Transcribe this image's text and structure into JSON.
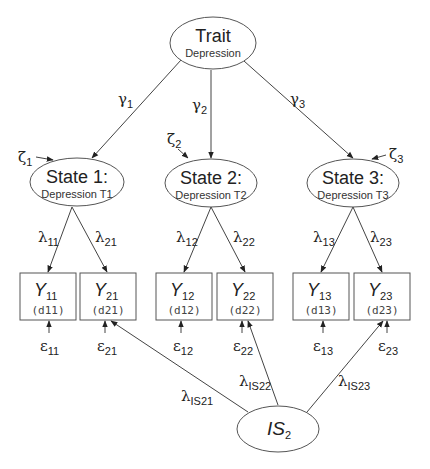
{
  "trait": {
    "title": "Trait",
    "subtitle": "Depression"
  },
  "states": [
    {
      "title": "State 1:",
      "subtitle": "Depression T1",
      "zeta_symbol": "ζ",
      "zeta_sub": "1",
      "gamma_symbol": "γ",
      "gamma_sub": "1"
    },
    {
      "title": "State 2:",
      "subtitle": "Depression T2",
      "zeta_symbol": "ζ",
      "zeta_sub": "2",
      "gamma_symbol": "γ",
      "gamma_sub": "2"
    },
    {
      "title": "State 3:",
      "subtitle": "Depression T3",
      "zeta_symbol": "ζ",
      "zeta_sub": "3",
      "gamma_symbol": "γ",
      "gamma_sub": "3"
    }
  ],
  "observed": [
    {
      "symbol": "Y",
      "sub": "11",
      "code": "(d11)",
      "eps_symbol": "ε",
      "eps_sub": "11",
      "lambda_symbol": "λ",
      "lambda_sub": "11"
    },
    {
      "symbol": "Y",
      "sub": "21",
      "code": "(d21)",
      "eps_symbol": "ε",
      "eps_sub": "21",
      "lambda_symbol": "λ",
      "lambda_sub": "21"
    },
    {
      "symbol": "Y",
      "sub": "12",
      "code": "(d12)",
      "eps_symbol": "ε",
      "eps_sub": "12",
      "lambda_symbol": "λ",
      "lambda_sub": "12"
    },
    {
      "symbol": "Y",
      "sub": "22",
      "code": "(d22)",
      "eps_symbol": "ε",
      "eps_sub": "22",
      "lambda_symbol": "λ",
      "lambda_sub": "22"
    },
    {
      "symbol": "Y",
      "sub": "13",
      "code": "(d13)",
      "eps_symbol": "ε",
      "eps_sub": "13",
      "lambda_symbol": "λ",
      "lambda_sub": "13"
    },
    {
      "symbol": "Y",
      "sub": "23",
      "code": "(d23)",
      "eps_symbol": "ε",
      "eps_sub": "23",
      "lambda_symbol": "λ",
      "lambda_sub": "23"
    }
  ],
  "indicator_specific": {
    "symbol": "IS",
    "sub": "2",
    "loadings": [
      {
        "symbol": "λ",
        "sub": "IS21"
      },
      {
        "symbol": "λ",
        "sub": "IS22"
      },
      {
        "symbol": "λ",
        "sub": "IS23"
      }
    ]
  }
}
